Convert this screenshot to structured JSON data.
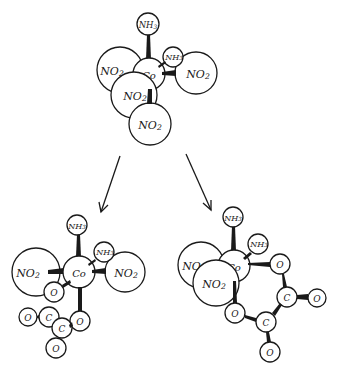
{
  "diagram": {
    "type": "molecular-structure",
    "colors": {
      "stroke": "#1a1a1a",
      "fill": "#ffffff",
      "background": "#ffffff"
    },
    "top_complex": {
      "center": "Co",
      "ligands": [
        "NH3",
        "NH3",
        "NO2",
        "NO2",
        "NO2",
        "NO2"
      ],
      "labels": {
        "co": "Co",
        "nh3_a": "NH3",
        "nh3_b": "NH3",
        "no2_a": "NO2",
        "no2_b": "NO2",
        "no2_c": "NO2",
        "no2_d": "NO2"
      }
    },
    "arrows": [
      {
        "from": "top_complex",
        "to": "left_product"
      },
      {
        "from": "top_complex",
        "to": "right_product"
      }
    ],
    "left_product": {
      "center": "Co",
      "ligands": [
        "NH3",
        "NH3",
        "NO2",
        "NO2",
        "C2O4 (oxalate, bidentate)"
      ],
      "labels": {
        "co": "Co",
        "nh3_a": "NH3",
        "nh3_b": "NH3",
        "no2_a": "NO2",
        "no2_b": "NO2",
        "o1": "O",
        "o2": "O",
        "o3": "O",
        "o4": "O",
        "c1": "C",
        "c2": "C"
      }
    },
    "right_product": {
      "center": "Co",
      "ligands": [
        "NH3",
        "NH3",
        "NO2",
        "NO2",
        "C2O4 (oxalate, bidentate)"
      ],
      "labels": {
        "co": "Co",
        "nh3_a": "NH3",
        "nh3_b": "NH3",
        "no2_a": "NO2",
        "no2_b": "NO2",
        "o1": "O",
        "o2": "O",
        "o3": "O",
        "o4": "O",
        "c1": "C",
        "c2": "C"
      }
    }
  }
}
